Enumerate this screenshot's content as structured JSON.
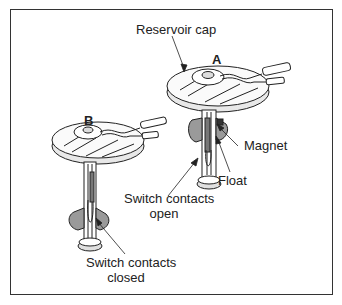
{
  "figure": {
    "labels": {
      "reservoir_cap": "Reservoir cap",
      "a": "A",
      "b": "B",
      "magnet": "Magnet",
      "float": "Float",
      "switch_open_line1": "Switch contacts",
      "switch_open_line2": "open",
      "switch_closed_line1": "Switch contacts",
      "switch_closed_line2": "closed"
    },
    "colors": {
      "line": "#222222",
      "shade": "#9a9a9a",
      "light_shade": "#d0d0d0",
      "border": "#333333"
    }
  }
}
